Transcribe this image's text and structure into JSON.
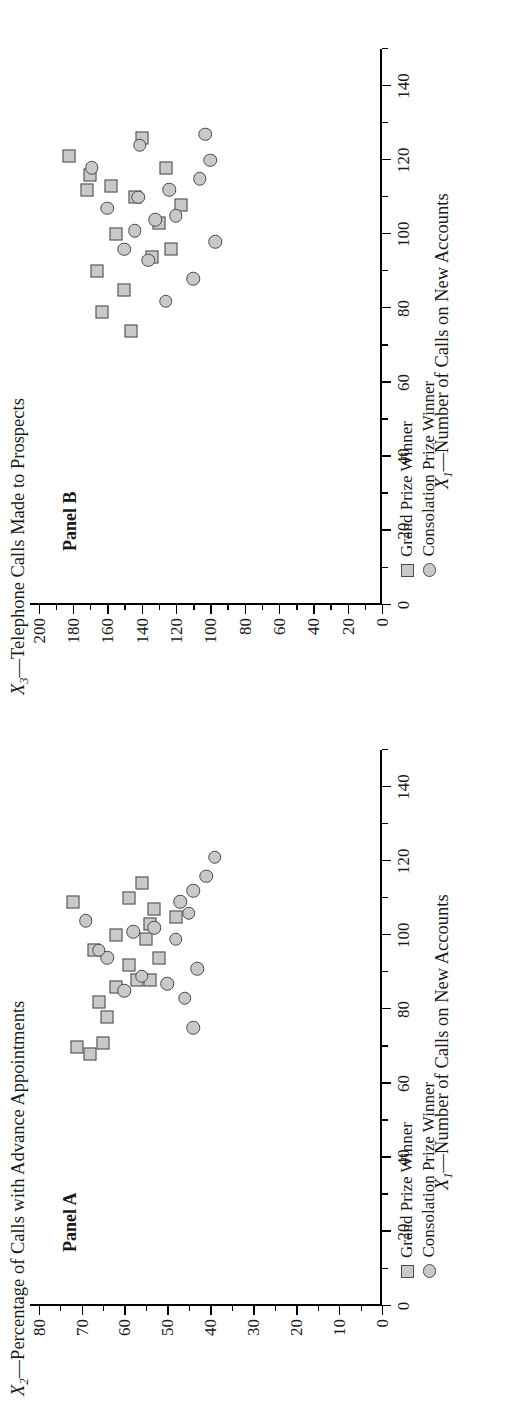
{
  "figure": {
    "marker_fill": "#c9c9c9",
    "marker_edge": "#4a4a4a",
    "background": "#ffffff"
  },
  "legend": {
    "items": [
      {
        "label": "Grand Prize Winner",
        "marker": "square"
      },
      {
        "label": "Consolation Prize Winner",
        "marker": "circle"
      }
    ]
  },
  "panels": [
    {
      "tag": "Panel A",
      "ylabel_prefix": "X",
      "ylabel_sub": "2",
      "ylabel_rest": "—Percentage of Calls with Advance Appointments",
      "xlabel_prefix": "X",
      "xlabel_sub": "1",
      "xlabel_rest": "—Number of Calls on New Accounts",
      "yticks": [
        "0",
        "10",
        "20",
        "30",
        "40",
        "50",
        "60",
        "70",
        "80"
      ],
      "xticks": [
        "0",
        "20",
        "40",
        "60",
        "80",
        "100",
        "120",
        "140"
      ]
    },
    {
      "tag": "Panel B",
      "ylabel_prefix": "X",
      "ylabel_sub": "3",
      "ylabel_rest": "—Telephone Calls Made to Prospects",
      "xlabel_prefix": "X",
      "xlabel_sub": "1",
      "xlabel_rest": "—Number of Calls on New Accounts",
      "yticks": [
        "0",
        "20",
        "40",
        "60",
        "80",
        "100",
        "120",
        "140",
        "160",
        "180",
        "200"
      ],
      "xticks": [
        "0",
        "20",
        "40",
        "60",
        "80",
        "100",
        "120",
        "140"
      ]
    }
  ],
  "chart_data": [
    {
      "type": "scatter",
      "title": "Panel A",
      "xlabel": "X1—Number of Calls on New Accounts",
      "ylabel": "X2—Percentage of Calls with Advance Appointments",
      "xlim": [
        0,
        150
      ],
      "ylim": [
        0,
        82
      ],
      "xticks": [
        0,
        20,
        40,
        60,
        80,
        100,
        120,
        140
      ],
      "yticks": [
        0,
        10,
        20,
        30,
        40,
        50,
        60,
        70,
        80
      ],
      "grid": false,
      "legend_position": "below-left",
      "series": [
        {
          "name": "Grand Prize Winner",
          "marker": "square",
          "points": [
            [
              68,
              68
            ],
            [
              70,
              71
            ],
            [
              71,
              65
            ],
            [
              78,
              64
            ],
            [
              82,
              66
            ],
            [
              86,
              62
            ],
            [
              88,
              57
            ],
            [
              88,
              54
            ],
            [
              92,
              59
            ],
            [
              94,
              52
            ],
            [
              96,
              67
            ],
            [
              99,
              55
            ],
            [
              100,
              62
            ],
            [
              103,
              54
            ],
            [
              105,
              48
            ],
            [
              107,
              53
            ],
            [
              109,
              72
            ],
            [
              110,
              59
            ],
            [
              114,
              56
            ]
          ]
        },
        {
          "name": "Consolation Prize Winner",
          "marker": "circle",
          "points": [
            [
              75,
              44
            ],
            [
              83,
              46
            ],
            [
              85,
              60
            ],
            [
              87,
              50
            ],
            [
              89,
              56
            ],
            [
              91,
              43
            ],
            [
              94,
              64
            ],
            [
              96,
              66
            ],
            [
              99,
              48
            ],
            [
              101,
              58
            ],
            [
              102,
              53
            ],
            [
              104,
              69
            ],
            [
              106,
              45
            ],
            [
              109,
              47
            ],
            [
              112,
              44
            ],
            [
              116,
              41
            ],
            [
              121,
              39
            ]
          ]
        }
      ]
    },
    {
      "type": "scatter",
      "title": "Panel B",
      "xlabel": "X1—Number of Calls on New Accounts",
      "ylabel": "X3—Telephone Calls Made to Prospects",
      "xlim": [
        0,
        150
      ],
      "ylim": [
        0,
        205
      ],
      "xticks": [
        0,
        20,
        40,
        60,
        80,
        100,
        120,
        140
      ],
      "yticks": [
        0,
        20,
        40,
        60,
        80,
        100,
        120,
        140,
        160,
        180,
        200
      ],
      "grid": false,
      "legend_position": "below-left",
      "series": [
        {
          "name": "Grand Prize Winner",
          "marker": "square",
          "points": [
            [
              74,
              146
            ],
            [
              79,
              163
            ],
            [
              85,
              150
            ],
            [
              90,
              166
            ],
            [
              94,
              134
            ],
            [
              96,
              123
            ],
            [
              100,
              155
            ],
            [
              103,
              130
            ],
            [
              108,
              117
            ],
            [
              110,
              144
            ],
            [
              112,
              172
            ],
            [
              113,
              158
            ],
            [
              116,
              170
            ],
            [
              118,
              126
            ],
            [
              121,
              182
            ],
            [
              126,
              140
            ]
          ]
        },
        {
          "name": "Consolation Prize Winner",
          "marker": "circle",
          "points": [
            [
              82,
              126
            ],
            [
              88,
              110
            ],
            [
              93,
              136
            ],
            [
              96,
              150
            ],
            [
              98,
              97
            ],
            [
              101,
              144
            ],
            [
              104,
              132
            ],
            [
              105,
              120
            ],
            [
              107,
              160
            ],
            [
              110,
              142
            ],
            [
              112,
              124
            ],
            [
              115,
              106
            ],
            [
              118,
              169
            ],
            [
              120,
              100
            ],
            [
              124,
              141
            ],
            [
              127,
              103
            ]
          ]
        }
      ]
    }
  ]
}
